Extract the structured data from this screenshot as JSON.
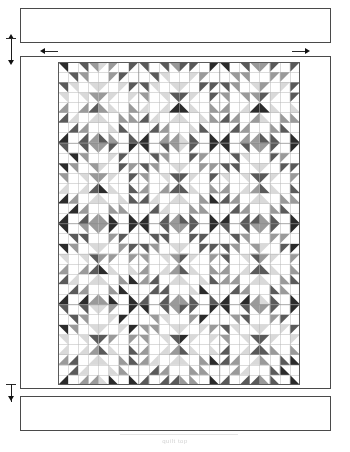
{
  "figure": {
    "caption": "quilt top",
    "type": "quilt-construction-diagram"
  },
  "colors": {
    "outline": "#4a4a4a",
    "grid_line": "#b8b8b8",
    "dimension": "#1b1b1b",
    "background": "#ffffff",
    "fabric_white": "#ffffff",
    "fabric_light": "#d9d9d9",
    "fabric_medium": "#9a9a9a",
    "fabric_dark": "#5a5a5a",
    "fabric_black": "#2b2b2b"
  },
  "components": {
    "top_border": {
      "name": "Top border strip",
      "x": 20,
      "y": 8,
      "width": 311,
      "height": 35
    },
    "bottom_border": {
      "name": "Bottom border strip",
      "x": 20,
      "y": 396,
      "width": 311,
      "height": 35
    },
    "quilt_body": {
      "name": "Pieced quilt center",
      "x": 20,
      "y": 56,
      "width": 311,
      "height": 333
    },
    "pieced_grid": {
      "name": "Half-square-triangle grid",
      "x": 58,
      "y": 62,
      "width": 242,
      "height": 323
    }
  },
  "dimensions": {
    "border_height_arrow": {
      "label": "",
      "orientation": "vertical",
      "x": 11,
      "y1": 38,
      "y2": 62
    },
    "quilt_width_arrow_left": {
      "label": "",
      "orientation": "horizontal-left",
      "x": 44,
      "y": 51
    },
    "quilt_width_arrow_right": {
      "label": "",
      "orientation": "horizontal-right",
      "x": 300,
      "y": 51
    },
    "bottom_border_arrow": {
      "label": "",
      "orientation": "vertical",
      "x": 11,
      "y1": 384,
      "y2": 400
    }
  },
  "chart_data": {
    "type": "heatmap",
    "xlabel": "",
    "ylabel": "",
    "grid": true,
    "legend": "none",
    "block_rows": 4,
    "block_cols": 3,
    "cells_per_block": 8,
    "grid_rows": 32,
    "grid_cols": 24,
    "cell_px": 10.08,
    "shade_values": [
      0,
      1,
      2,
      3,
      4
    ],
    "shade_hex": [
      "#ffffff",
      "#d9d9d9",
      "#9a9a9a",
      "#5a5a5a",
      "#2b2b2b"
    ],
    "shade_names": [
      "white",
      "light",
      "medium",
      "dark",
      "black"
    ],
    "block_pattern_shades": [
      [
        4,
        0,
        3,
        0,
        0,
        1,
        0,
        2,
        0,
        2,
        0,
        1,
        0,
        0,
        3,
        0
      ],
      [
        0,
        0,
        0,
        3,
        1,
        0,
        2,
        0,
        0,
        2,
        0,
        1,
        3,
        0,
        0,
        0
      ],
      [
        3,
        0,
        4,
        0,
        0,
        2,
        0,
        1,
        0,
        1,
        0,
        2,
        0,
        0,
        4,
        0
      ],
      [
        0,
        0,
        0,
        4,
        2,
        0,
        1,
        0,
        0,
        1,
        0,
        2,
        4,
        0,
        0,
        0
      ],
      [
        0,
        2,
        0,
        1,
        3,
        0,
        4,
        0,
        0,
        4,
        0,
        3,
        1,
        0,
        2,
        0
      ],
      [
        2,
        0,
        1,
        0,
        0,
        4,
        0,
        3,
        3,
        0,
        4,
        0,
        0,
        1,
        0,
        2
      ],
      [
        0,
        1,
        0,
        2,
        4,
        0,
        3,
        0,
        0,
        3,
        0,
        4,
        2,
        0,
        1,
        0
      ],
      [
        1,
        0,
        2,
        0,
        0,
        3,
        0,
        4,
        4,
        0,
        3,
        0,
        0,
        2,
        0,
        1
      ]
    ],
    "seed": 20240517
  }
}
